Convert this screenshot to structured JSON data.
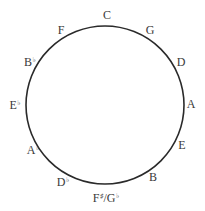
{
  "diagram": {
    "circle": {
      "cx": 105,
      "cy": 105,
      "r": 79,
      "stroke": "#2a2a2a",
      "stroke_width": 1.6
    },
    "labels": [
      {
        "name": "C",
        "base": "C",
        "acc": "",
        "x": 107,
        "y": 15
      },
      {
        "name": "G",
        "base": "G",
        "acc": "",
        "x": 150,
        "y": 30
      },
      {
        "name": "D",
        "base": "D",
        "acc": "",
        "x": 181,
        "y": 62
      },
      {
        "name": "A",
        "base": "A",
        "acc": "",
        "x": 191,
        "y": 104
      },
      {
        "name": "E",
        "base": "E",
        "acc": "",
        "x": 182,
        "y": 145
      },
      {
        "name": "B",
        "base": "B",
        "acc": "",
        "x": 153,
        "y": 177
      },
      {
        "name": "F-sharp/G-flat",
        "base": "F",
        "acc": "♯",
        "base2": "/G",
        "acc2": "♭",
        "x": 106,
        "y": 198
      },
      {
        "name": "D-flat",
        "base": "D",
        "acc": "♭",
        "x": 63,
        "y": 182
      },
      {
        "name": "A-flat",
        "base": "A",
        "acc": "♭",
        "x": 33,
        "y": 150
      },
      {
        "name": "E-flat",
        "base": "E",
        "acc": "♭",
        "x": 15,
        "y": 105
      },
      {
        "name": "B-flat",
        "base": "B",
        "acc": "♭",
        "x": 30,
        "y": 62
      },
      {
        "name": "F",
        "base": "F",
        "acc": "",
        "x": 61,
        "y": 30
      }
    ]
  }
}
